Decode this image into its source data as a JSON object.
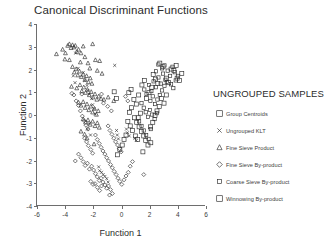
{
  "chart_data": {
    "type": "scatter",
    "title": "Canonical Discriminant Functions",
    "xlabel": "Function 1",
    "ylabel": "Function 2",
    "xlim": [
      -6,
      6
    ],
    "ylim": [
      -4,
      4
    ],
    "xticks": [
      -6,
      -4,
      -2,
      0,
      2,
      4,
      6
    ],
    "yticks": [
      -4,
      -3,
      -2,
      -1,
      0,
      1,
      2,
      3,
      4
    ],
    "xtick_labels": [
      "-6",
      "-4",
      "-2",
      "0",
      "2",
      "4",
      "6"
    ],
    "ytick_labels": [
      "-4",
      "-3",
      "-2",
      "-1",
      "0",
      "1",
      "2",
      "3",
      "4"
    ],
    "grid": false,
    "legend_position": "right",
    "legend_title": "UNGROUPED SAMPLES",
    "series": [
      {
        "name": "Ungrouped KLT",
        "marker": "x",
        "icon": "x-marker-icon",
        "points": [
          [
            -3.25,
            2.72
          ],
          [
            -3.08,
            2.05
          ],
          [
            -2.72,
            1.87
          ],
          [
            -2.6,
            1.52
          ],
          [
            -2.45,
            1.3
          ],
          [
            -2.38,
            1.08
          ],
          [
            -2.3,
            0.92
          ],
          [
            -2.12,
            0.72
          ],
          [
            -2.05,
            0.45
          ],
          [
            -1.95,
            0.28
          ],
          [
            -1.88,
            0.05
          ],
          [
            -2.3,
            -0.38
          ],
          [
            -2.42,
            -0.62
          ],
          [
            -2.2,
            -0.88
          ],
          [
            -1.62,
            -2.28
          ],
          [
            -1.55,
            -2.45
          ],
          [
            -1.42,
            -2.52
          ],
          [
            -1.3,
            -2.62
          ],
          [
            -1.18,
            -2.7
          ],
          [
            -1.05,
            -2.8
          ],
          [
            -0.95,
            -2.95
          ],
          [
            -0.48,
            2.18
          ],
          [
            -0.35,
            -0.68
          ],
          [
            -0.3,
            -0.88
          ],
          [
            -0.22,
            -1.05
          ],
          [
            0.35,
            -0.62
          ],
          [
            0.42,
            -0.78
          ],
          [
            0.55,
            -0.92
          ],
          [
            0.95,
            -1.02
          ],
          [
            1.05,
            -1.12
          ],
          [
            -3.42,
            1.72
          ],
          [
            -3.3,
            1.42
          ]
        ]
      },
      {
        "name": "Fine Sieve Product",
        "marker": "triangle",
        "icon": "triangle-marker-icon",
        "points": [
          [
            -4.62,
            2.68
          ],
          [
            -4.18,
            2.88
          ],
          [
            -3.98,
            2.72
          ],
          [
            -3.82,
            3.05
          ],
          [
            -3.7,
            3.12
          ],
          [
            -3.58,
            2.95
          ],
          [
            -3.48,
            3.08
          ],
          [
            -3.38,
            2.98
          ],
          [
            -3.28,
            3.05
          ],
          [
            -3.18,
            2.78
          ],
          [
            -3.05,
            2.88
          ],
          [
            -2.88,
            2.72
          ],
          [
            -2.72,
            3.02
          ],
          [
            -2.6,
            2.55
          ],
          [
            -2.05,
            3.12
          ],
          [
            -1.85,
            2.42
          ],
          [
            -2.38,
            2.28
          ],
          [
            -2.25,
            2.05
          ],
          [
            -1.55,
            2.38
          ],
          [
            -1.72,
            1.95
          ],
          [
            -3.48,
            2.12
          ],
          [
            -3.35,
            1.88
          ],
          [
            -3.22,
            2.02
          ],
          [
            -3.1,
            1.75
          ],
          [
            -2.98,
            1.92
          ],
          [
            -2.85,
            1.68
          ],
          [
            -2.72,
            1.78
          ],
          [
            -2.6,
            1.55
          ],
          [
            -2.48,
            1.72
          ],
          [
            -2.35,
            1.45
          ],
          [
            -2.22,
            1.62
          ],
          [
            -2.1,
            1.38
          ],
          [
            -3.55,
            1.25
          ],
          [
            -3.18,
            1.18
          ],
          [
            -2.95,
            1.32
          ],
          [
            -2.82,
            1.05
          ],
          [
            -2.68,
            1.22
          ],
          [
            -2.55,
            0.98
          ],
          [
            -2.42,
            1.12
          ],
          [
            -2.28,
            0.88
          ],
          [
            -2.15,
            1.02
          ],
          [
            -2.02,
            0.78
          ],
          [
            -1.88,
            0.92
          ],
          [
            -1.75,
            0.68
          ],
          [
            -1.62,
            0.82
          ],
          [
            -1.45,
            0.72
          ],
          [
            -1.25,
            0.68
          ],
          [
            -0.95,
            0.78
          ],
          [
            -0.55,
            0.62
          ],
          [
            -3.05,
            0.55
          ],
          [
            -2.88,
            0.42
          ],
          [
            -2.72,
            0.58
          ],
          [
            -2.58,
            0.32
          ],
          [
            -2.45,
            0.48
          ],
          [
            -2.32,
            0.22
          ],
          [
            -2.18,
            0.38
          ],
          [
            -2.05,
            0.12
          ],
          [
            -1.92,
            0.28
          ],
          [
            -1.78,
            0.02
          ],
          [
            -1.65,
            0.18
          ],
          [
            -2.72,
            -0.18
          ],
          [
            -2.55,
            -0.32
          ],
          [
            -2.38,
            -0.22
          ],
          [
            -2.22,
            -0.42
          ],
          [
            -2.05,
            -0.28
          ],
          [
            -1.88,
            -0.48
          ],
          [
            -1.72,
            -0.35
          ],
          [
            -1.58,
            -0.55
          ],
          [
            -2.88,
            -0.72
          ],
          [
            -2.62,
            -0.85
          ],
          [
            -2.45,
            -1.02
          ],
          [
            -1.95,
            -1.28
          ],
          [
            -3.7,
            2.42
          ],
          [
            -4.02,
            2.45
          ],
          [
            -2.92,
            2.32
          ],
          [
            -1.38,
            1.82
          ]
        ]
      },
      {
        "name": "Fine Sieve By-product",
        "marker": "diamond",
        "icon": "diamond-marker-icon",
        "points": [
          [
            -3.38,
            0.88
          ],
          [
            -3.22,
            0.62
          ],
          [
            -3.05,
            0.42
          ],
          [
            -2.92,
            0.18
          ],
          [
            -2.78,
            -0.05
          ],
          [
            -2.65,
            -0.25
          ],
          [
            -2.52,
            -0.45
          ],
          [
            -2.38,
            -0.62
          ],
          [
            -2.62,
            -1.02
          ],
          [
            -2.48,
            -1.18
          ],
          [
            -2.35,
            -1.35
          ],
          [
            -2.18,
            -1.52
          ],
          [
            -2.05,
            -1.68
          ],
          [
            -3.28,
            -2.02
          ],
          [
            -3.05,
            -1.72
          ],
          [
            -2.88,
            -1.88
          ],
          [
            -2.72,
            -2.05
          ],
          [
            -2.58,
            -2.22
          ],
          [
            -2.42,
            -2.12
          ],
          [
            -2.28,
            -2.38
          ],
          [
            -2.12,
            -2.25
          ],
          [
            -1.98,
            -2.42
          ],
          [
            -1.85,
            -2.58
          ],
          [
            -1.72,
            -2.72
          ],
          [
            -1.58,
            -2.88
          ],
          [
            -1.45,
            -2.78
          ],
          [
            -1.32,
            -2.95
          ],
          [
            -1.18,
            -3.08
          ],
          [
            -1.05,
            -3.22
          ],
          [
            -0.92,
            -3.12
          ],
          [
            -0.78,
            -3.28
          ],
          [
            -0.65,
            -3.45
          ],
          [
            -1.88,
            -3.02
          ],
          [
            -1.72,
            -3.18
          ],
          [
            -1.55,
            -3.32
          ],
          [
            -1.42,
            -3.12
          ],
          [
            -2.18,
            -2.92
          ],
          [
            -2.02,
            -3.05
          ],
          [
            -1.85,
            -0.88
          ],
          [
            -1.72,
            -1.08
          ],
          [
            -1.58,
            -1.25
          ],
          [
            -1.45,
            -1.42
          ],
          [
            -1.32,
            -1.58
          ],
          [
            -1.18,
            -1.72
          ],
          [
            -1.05,
            -1.88
          ],
          [
            -0.92,
            -2.02
          ],
          [
            -0.78,
            -2.18
          ],
          [
            -0.65,
            -2.32
          ],
          [
            -0.52,
            -2.48
          ],
          [
            -0.38,
            -2.62
          ],
          [
            -0.25,
            -2.78
          ],
          [
            -0.12,
            -2.92
          ],
          [
            0.02,
            -3.05
          ],
          [
            0.18,
            -2.85
          ],
          [
            0.32,
            -2.68
          ],
          [
            0.48,
            -2.52
          ],
          [
            -0.95,
            -0.48
          ],
          [
            -0.82,
            -0.68
          ],
          [
            -0.68,
            -0.85
          ],
          [
            -0.55,
            -1.02
          ],
          [
            -0.42,
            -1.18
          ],
          [
            -0.28,
            -1.32
          ],
          [
            -0.15,
            -1.48
          ],
          [
            -0.02,
            -1.62
          ],
          [
            -1.42,
            0.92
          ],
          [
            -1.28,
            0.52
          ],
          [
            -0.98,
            0.38
          ],
          [
            -0.72,
            0.18
          ],
          [
            0.28,
            0.82
          ],
          [
            0.45,
            0.62
          ],
          [
            -0.85,
            -3.52
          ],
          [
            1.58,
            -2.62
          ],
          [
            0.62,
            -2.25
          ],
          [
            0.78,
            -2.05
          ],
          [
            -2.82,
            0.92
          ],
          [
            -3.52,
            0.95
          ]
        ]
      },
      {
        "name": "Coarse Sieve By-product",
        "marker": "square-small",
        "icon": "small-square-marker-icon",
        "points": [
          [
            1.62,
            1.12
          ],
          [
            1.78,
            0.92
          ],
          [
            1.95,
            1.32
          ],
          [
            2.12,
            1.05
          ],
          [
            2.28,
            1.48
          ],
          [
            2.45,
            1.22
          ],
          [
            2.62,
            1.65
          ],
          [
            2.78,
            1.38
          ],
          [
            2.95,
            1.82
          ],
          [
            3.12,
            1.55
          ],
          [
            3.28,
            1.95
          ],
          [
            3.45,
            1.72
          ],
          [
            3.62,
            2.12
          ],
          [
            3.78,
            1.88
          ],
          [
            2.05,
            0.62
          ],
          [
            2.22,
            0.82
          ],
          [
            2.38,
            0.48
          ],
          [
            2.55,
            0.68
          ],
          [
            2.72,
            0.88
          ],
          [
            2.88,
            1.08
          ],
          [
            3.05,
            1.28
          ],
          [
            3.22,
            1.45
          ],
          [
            1.42,
            0.52
          ],
          [
            1.58,
            0.32
          ],
          [
            1.72,
            0.12
          ],
          [
            1.88,
            -0.08
          ],
          [
            2.02,
            0.22
          ],
          [
            2.18,
            0.02
          ],
          [
            2.35,
            -0.18
          ],
          [
            2.52,
            0.08
          ],
          [
            1.25,
            -0.28
          ],
          [
            1.42,
            -0.48
          ],
          [
            1.58,
            -0.68
          ],
          [
            1.75,
            -0.88
          ],
          [
            1.92,
            -1.05
          ],
          [
            2.08,
            -0.62
          ],
          [
            2.62,
            2.22
          ],
          [
            2.88,
            2.05
          ],
          [
            3.05,
            2.18
          ],
          [
            3.52,
            1.35
          ],
          [
            3.68,
            1.18
          ],
          [
            3.85,
            1.52
          ],
          [
            4.02,
            1.72
          ],
          [
            2.45,
            1.92
          ]
        ]
      },
      {
        "name": "Winnowing By-product",
        "marker": "square",
        "icon": "square-marker-icon",
        "points": [
          [
            0.88,
            0.68
          ],
          [
            1.05,
            0.48
          ],
          [
            1.22,
            0.88
          ],
          [
            0.72,
            0.32
          ],
          [
            0.58,
            0.12
          ],
          [
            0.92,
            -0.12
          ],
          [
            1.08,
            -0.32
          ],
          [
            1.25,
            -0.52
          ],
          [
            1.42,
            -0.72
          ],
          [
            1.58,
            -0.92
          ],
          [
            1.72,
            -1.12
          ],
          [
            1.88,
            -1.32
          ],
          [
            0.45,
            -0.28
          ],
          [
            0.62,
            -0.48
          ],
          [
            0.78,
            -0.68
          ],
          [
            0.32,
            -0.88
          ],
          [
            0.18,
            -1.08
          ],
          [
            0.05,
            -1.32
          ],
          [
            -0.12,
            -1.52
          ],
          [
            -0.28,
            -1.75
          ],
          [
            2.72,
            2.28
          ],
          [
            2.95,
            2.12
          ],
          [
            3.18,
            1.62
          ],
          [
            3.35,
            1.42
          ],
          [
            3.52,
            2.02
          ],
          [
            3.72,
            1.95
          ],
          [
            3.95,
            1.62
          ],
          [
            4.12,
            1.52
          ],
          [
            2.25,
            1.78
          ],
          [
            2.42,
            1.58
          ],
          [
            2.58,
            1.38
          ],
          [
            2.15,
            1.22
          ],
          [
            1.95,
            0.98
          ],
          [
            1.78,
            0.72
          ],
          [
            1.62,
            1.52
          ],
          [
            1.45,
            1.32
          ],
          [
            2.85,
            0.72
          ],
          [
            3.02,
            0.52
          ],
          [
            3.18,
            0.88
          ],
          [
            2.68,
            0.38
          ],
          [
            2.52,
            0.18
          ],
          [
            2.38,
            -0.02
          ],
          [
            2.22,
            -0.32
          ],
          [
            2.05,
            -0.52
          ],
          [
            1.35,
            0.08
          ],
          [
            1.18,
            -0.12
          ],
          [
            0.98,
            -0.92
          ],
          [
            1.15,
            -1.08
          ],
          [
            0.52,
            0.98
          ],
          [
            0.68,
            1.12
          ],
          [
            -0.35,
            0.72
          ],
          [
            -0.52,
            1.02
          ],
          [
            4.28,
            1.82
          ],
          [
            3.88,
            2.18
          ],
          [
            2.08,
            -1.22
          ],
          [
            1.52,
            -1.62
          ]
        ]
      }
    ],
    "legend_entries": [
      {
        "label": "Group Centroids",
        "marker": "square-open",
        "icon": "square-marker-icon"
      },
      {
        "label": "Ungrouped KLT",
        "marker": "x",
        "icon": "x-marker-icon"
      },
      {
        "label": "Fine Sieve Product",
        "marker": "triangle",
        "icon": "triangle-marker-icon"
      },
      {
        "label": "Fine Sieve By-product",
        "marker": "diamond",
        "icon": "diamond-marker-icon"
      },
      {
        "label": "Coarse Sieve By-product",
        "marker": "square-small",
        "icon": "small-square-marker-icon"
      },
      {
        "label": "Winnowing By-product",
        "marker": "square",
        "icon": "square-marker-icon"
      }
    ]
  },
  "colors": {
    "marker": "#2b2b2b",
    "axis": "#6e6e6e",
    "text": "#2b2b2b",
    "background": "#ffffff"
  }
}
